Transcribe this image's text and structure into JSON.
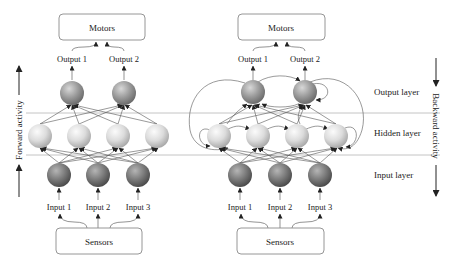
{
  "colors": {
    "output_node": "#8e8e8e",
    "hidden_node": "#d6d6d6",
    "input_node": "#6f6f6f",
    "line": "#555555",
    "separator": "#b5b5b5"
  },
  "left_network": {
    "name": "feedforward",
    "motors_label": "Motors",
    "sensors_label": "Sensors",
    "outputs": [
      "Output 1",
      "Output 2"
    ],
    "inputs": [
      "Input 1",
      "Input 2",
      "Input 3"
    ],
    "layers": {
      "output_nodes": 2,
      "hidden_nodes": 4,
      "input_nodes": 3
    }
  },
  "right_network": {
    "name": "recurrent",
    "motors_label": "Motors",
    "sensors_label": "Sensors",
    "outputs": [
      "Output 1",
      "Output 2"
    ],
    "inputs": [
      "Input 1",
      "Input 2",
      "Input 3"
    ],
    "layers": {
      "output_nodes": 2,
      "hidden_nodes": 4,
      "input_nodes": 3
    }
  },
  "layer_labels": {
    "output": "Output layer",
    "hidden": "Hidden layer",
    "input": "Input layer"
  },
  "side_labels": {
    "forward": "Forward activity",
    "backward": "Backward activity"
  }
}
